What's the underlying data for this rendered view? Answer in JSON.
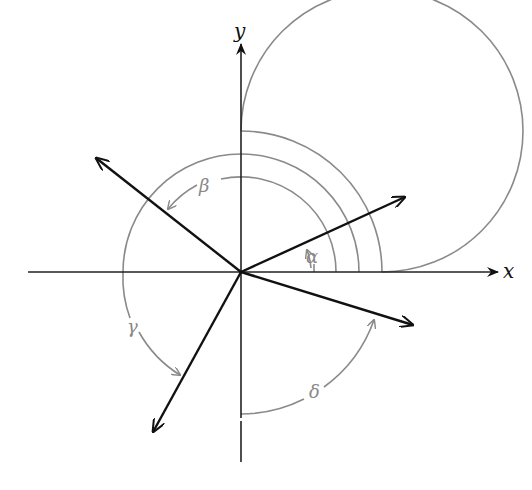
{
  "diagram": {
    "title": "",
    "axes": {
      "x_label": "x",
      "y_label": "y"
    },
    "center": [
      241,
      272
    ],
    "circle_radii": [
      95,
      118,
      141
    ],
    "vectors": [
      {
        "name": "alpha-vector",
        "angle_deg": 22,
        "tip": [
          405,
          197
        ]
      },
      {
        "name": "beta-vector",
        "angle_deg": 142,
        "tip": [
          96,
          158
        ]
      },
      {
        "name": "gamma-vector",
        "angle_deg": 240,
        "tip": [
          153,
          432
        ]
      },
      {
        "name": "delta-vector",
        "angle_deg": -19,
        "tip": [
          413,
          325
        ]
      }
    ],
    "angle_labels": {
      "alpha": "α",
      "beta": "β",
      "gamma": "γ",
      "delta": "δ"
    },
    "colors": {
      "axis": "#222222",
      "vector": "#111111",
      "arc": "#8a8a8a",
      "background": "#ffffff"
    }
  }
}
